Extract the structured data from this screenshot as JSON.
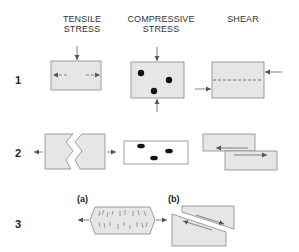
{
  "headers": {
    "tensile": [
      "TENSILE",
      "STRESS"
    ],
    "compressive": [
      "COMPRESSIVE",
      "STRESS"
    ],
    "shear": [
      "SHEAR"
    ]
  },
  "rows": [
    {
      "number": "1",
      "description": "Stress types applied to blocks"
    },
    {
      "number": "2",
      "description": "Resulting deformation/failure"
    },
    {
      "number": "3",
      "description": "Detailed failure modes"
    }
  ],
  "row3_sublabels": {
    "a": "(a)",
    "b": "(b)"
  },
  "colors": {
    "box_fill": "#e6e6e6",
    "box_stroke": "#888888",
    "arrow": "#555555",
    "dot": "#111111",
    "text": "#333333"
  }
}
